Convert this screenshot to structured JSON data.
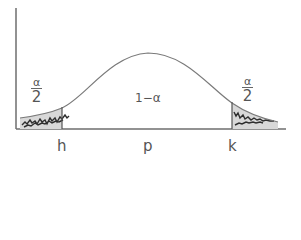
{
  "diagram": {
    "type": "normal-distribution-confidence-interval",
    "curve_color": "#7a7a7a",
    "axis_color": "#6e6e6e",
    "tail_fill_color": "#3a3a3a",
    "labels": {
      "left_tail": {
        "numerator": "α",
        "denominator": "2"
      },
      "right_tail": {
        "numerator": "α",
        "denominator": "2"
      },
      "center": "1−α",
      "x_ticks": [
        "h",
        "p",
        "k"
      ]
    }
  }
}
